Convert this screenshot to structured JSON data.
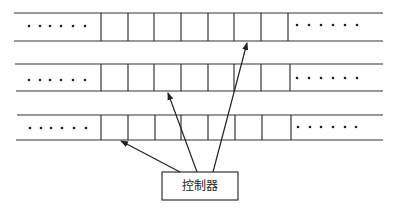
{
  "diagram": {
    "controller_label": "控制器",
    "ellipsis": "••••••",
    "line_color": "#333333",
    "rows": [
      {
        "top": 13,
        "bottom": 41,
        "dividers": [
          101,
          128,
          154,
          181,
          208,
          234,
          261,
          288
        ]
      },
      {
        "top": 64,
        "bottom": 91,
        "dividers": [
          101,
          128,
          154,
          181,
          208,
          234,
          261,
          290
        ]
      },
      {
        "top": 115,
        "bottom": 140,
        "dividers": [
          101,
          128,
          154,
          181,
          208,
          234,
          262,
          291
        ]
      }
    ],
    "controller_box": {
      "x": 162,
      "y": 172,
      "w": 76,
      "h": 28
    },
    "arrows": [
      {
        "from": [
          180,
          172
        ],
        "to": [
          120,
          141
        ],
        "target": "row-3-cell-1"
      },
      {
        "from": [
          197,
          172
        ],
        "to": [
          168,
          92
        ],
        "target": "row-2-cell-3"
      },
      {
        "from": [
          213,
          172
        ],
        "to": [
          248,
          42
        ],
        "target": "row-1-cell-6"
      }
    ]
  }
}
